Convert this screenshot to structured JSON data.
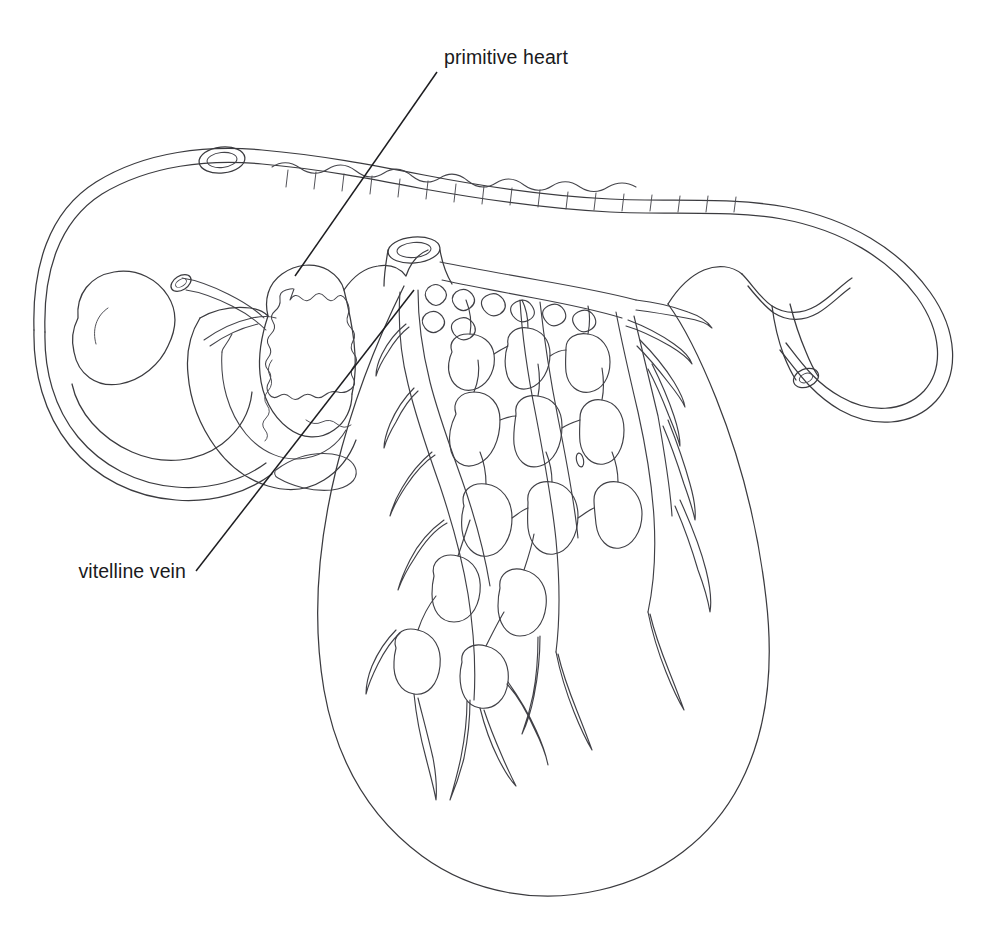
{
  "figure": {
    "kind": "anatomical-line-drawing",
    "background_color": "#ffffff",
    "line_color": "#3b3b3f",
    "leader_color": "#1d1d20",
    "text_color": "#1a1a1c",
    "width": 1000,
    "height": 925
  },
  "labels": [
    {
      "id": "primitive-heart",
      "text": "primitive heart",
      "x": 444,
      "y": 64,
      "anchor": "start",
      "leader": {
        "x1": 437,
        "y1": 72,
        "x2": 295,
        "y2": 276
      }
    },
    {
      "id": "vitelline-vein",
      "text": "vitelline vein",
      "x": 186,
      "y": 578,
      "anchor": "end",
      "leader": {
        "x1": 196,
        "y1": 571,
        "x2": 414,
        "y2": 290
      }
    }
  ],
  "structures": {
    "amnion": "double-contour membrane enclosing embryo",
    "brain_vesicle": "large rounded forebrain vesicle at left",
    "otic_vesicle": "small oval at dorsal head",
    "optic_stalk": "short tube with open ellipse mouth",
    "heart": "looped primitive heart with crenellated trabeculae",
    "somites": "scalloped dorsal segments along the back",
    "tail": "curved caudal region looping to the right",
    "allantois": "tube ending in cut-open circular lumen",
    "yolk_sac": "large pear-shaped sac below",
    "vitelline_plexus": "branching polygonal capillary network on yolk sac",
    "vessel_stump": "cut-open vessel with elliptical lumen"
  }
}
